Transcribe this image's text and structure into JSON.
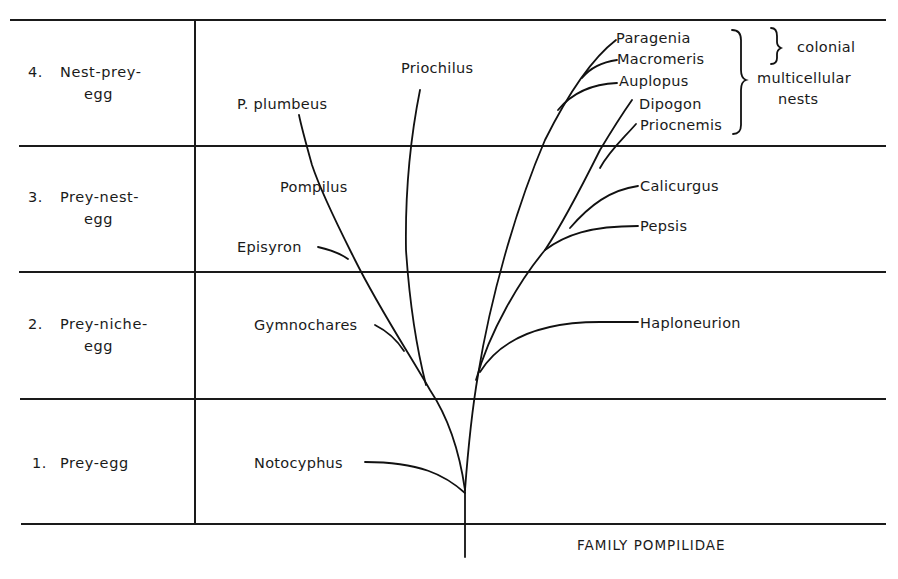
{
  "diagram": {
    "title": "FAMILY POMPILIDAE",
    "stages": [
      {
        "number": "4.",
        "line1": "Nest-prey-",
        "line2": "egg"
      },
      {
        "number": "3.",
        "line1": "Prey-nest-",
        "line2": "egg"
      },
      {
        "number": "2.",
        "line1": "Prey-niche-",
        "line2": "egg"
      },
      {
        "number": "1.",
        "line1": "Prey-egg",
        "line2": ""
      }
    ],
    "taxa": {
      "p_plumbeus": "P. plumbeus",
      "priochilus": "Priochilus",
      "pompilus": "Pompilus",
      "episyron": "Episyron",
      "gymnochares": "Gymnochares",
      "notocyphus": "Notocyphus",
      "paragenia": "Paragenia",
      "macromeris": "Macromeris",
      "auplopus": "Auplopus",
      "dipogon": "Dipogon",
      "priocnemis": "Priocnemis",
      "calicurgus": "Calicurgus",
      "pepsis": "Pepsis",
      "haploneurion": "Haploneurion"
    },
    "annotations": {
      "colonial": "colonial",
      "multicellular_line1": "multicellular",
      "multicellular_line2": "nests"
    },
    "colors": {
      "ink": "#1a1a1a",
      "background": "#ffffff"
    }
  }
}
